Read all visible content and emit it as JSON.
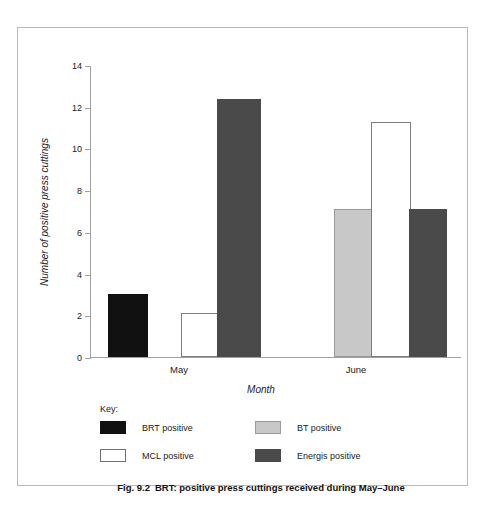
{
  "chart_data": {
    "type": "bar",
    "title": "BRT: positive press cuttings received during May–June",
    "xlabel": "Month",
    "ylabel": "Number of positive press cuttings",
    "categories": [
      "May",
      "June"
    ],
    "ylim": [
      0,
      14
    ],
    "yticks": [
      0,
      2,
      4,
      6,
      8,
      10,
      12,
      14
    ],
    "ytick_labels": [
      "0",
      "2",
      "4",
      "6",
      "8",
      "10",
      "12",
      "14"
    ],
    "grid": false,
    "legend_position": "below-axes",
    "legend_title": "Key:",
    "series": [
      {
        "name": "BRT positive",
        "color": "#111111",
        "values": [
          3.0,
          null
        ]
      },
      {
        "name": "MCL positive",
        "color": "#ffffff",
        "values": [
          2.1,
          11.25
        ]
      },
      {
        "name": "BT positive",
        "color": "#c8c8c8",
        "values": [
          null,
          7.1
        ]
      },
      {
        "name": "Energis positive",
        "color": "#4a4a4a",
        "values": [
          12.35,
          7.1
        ]
      }
    ],
    "bars": [
      {
        "label": "BRT positive May",
        "category": "May",
        "series": "BRT positive",
        "value": 3.0,
        "style": "solid-black",
        "x": 17,
        "width": 40
      },
      {
        "label": "MCL positive May",
        "category": "May",
        "series": "MCL positive",
        "value": 2.1,
        "style": "solid-white",
        "x": 90,
        "width": 38
      },
      {
        "label": "Energis positive May",
        "category": "May",
        "series": "Energis positive",
        "value": 12.35,
        "style": "solid-dkgray",
        "x": 126,
        "width": 44
      },
      {
        "label": "BT positive June",
        "category": "June",
        "series": "BT positive",
        "value": 7.1,
        "style": "solid-ltgray",
        "x": 243,
        "width": 39
      },
      {
        "label": "MCL positive June",
        "category": "June",
        "series": "MCL positive",
        "value": 11.25,
        "style": "solid-white",
        "x": 280,
        "width": 40
      },
      {
        "label": "Energis positive June",
        "category": "June",
        "series": "Energis positive",
        "value": 7.1,
        "style": "solid-dkgray",
        "x": 318,
        "width": 38
      }
    ],
    "category_label_positions": [
      106,
      283
    ]
  },
  "legend": {
    "title": "Key:",
    "entries": [
      {
        "label": "BRT positive",
        "swatch": "sw-black",
        "row": 0,
        "col": 0
      },
      {
        "label": "BT positive",
        "swatch": "sw-ltgray",
        "row": 0,
        "col": 1
      },
      {
        "label": "MCL positive",
        "swatch": "sw-white",
        "row": 1,
        "col": 0
      },
      {
        "label": "Energis positive",
        "swatch": "sw-dkgray",
        "row": 1,
        "col": 1
      }
    ]
  },
  "caption": {
    "figure_number": "Fig. 9.2",
    "text": "BRT: positive press cuttings received during May–June"
  }
}
